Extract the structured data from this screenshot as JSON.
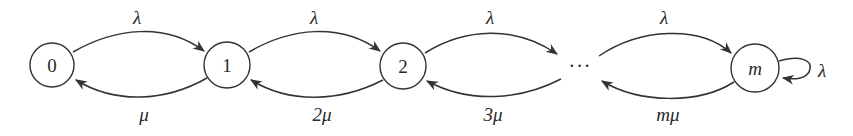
{
  "diagram": {
    "type": "birth-death state transition diagram",
    "nodes": [
      {
        "id": "0",
        "label": "0",
        "cx": 52,
        "cy": 65
      },
      {
        "id": "1",
        "label": "1",
        "cx": 227,
        "cy": 65
      },
      {
        "id": "2",
        "label": "2",
        "cx": 403,
        "cy": 66
      },
      {
        "id": "m",
        "label": "m",
        "cx": 755,
        "cy": 68
      }
    ],
    "ellipsis": "···",
    "forward_edges": [
      {
        "from": "0",
        "to": "1",
        "label": "λ"
      },
      {
        "from": "1",
        "to": "2",
        "label": "λ"
      },
      {
        "from": "2",
        "to": "…",
        "label": "λ"
      },
      {
        "from": "…",
        "to": "m",
        "label": "λ"
      }
    ],
    "backward_edges": [
      {
        "from": "1",
        "to": "0",
        "label": "μ"
      },
      {
        "from": "2",
        "to": "1",
        "label": "2μ"
      },
      {
        "from": "…",
        "to": "2",
        "label": "3μ"
      },
      {
        "from": "m",
        "to": "…",
        "label": "mμ"
      }
    ],
    "self_loop": {
      "node": "m",
      "label": "λ"
    },
    "colors": {
      "stroke": "#333333",
      "text": "#2a2a2a",
      "background": "#ffffff"
    }
  }
}
